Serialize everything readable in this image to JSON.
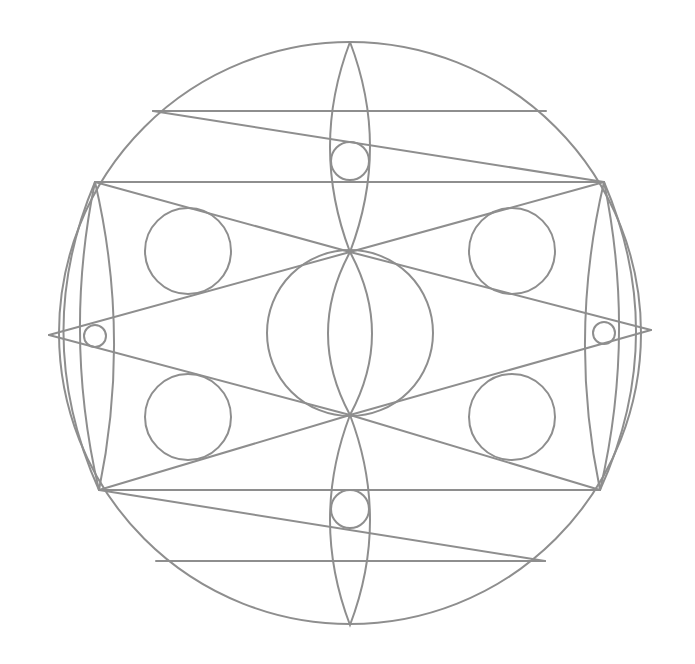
{
  "diagram": {
    "type": "geometric-mandala",
    "stroke_color": "#8e8e8e",
    "background_color": "#ffffff",
    "outer_circle": {
      "cx": 350,
      "cy": 333,
      "r": 291
    },
    "horizontal_lines": [
      {
        "x1": 153,
        "y1": 111,
        "x2": 546,
        "y2": 111
      },
      {
        "x1": 95,
        "y1": 182,
        "x2": 604,
        "y2": 182
      },
      {
        "x1": 99,
        "y1": 490,
        "x2": 600,
        "y2": 490
      },
      {
        "x1": 156,
        "y1": 561,
        "x2": 545,
        "y2": 561
      }
    ],
    "diagonal_lines": [
      {
        "x1": 153,
        "y1": 111,
        "x2": 604,
        "y2": 182
      },
      {
        "x1": 99,
        "y1": 490,
        "x2": 545,
        "y2": 561
      },
      {
        "x1": 95,
        "y1": 182,
        "x2": 350,
        "y2": 252
      },
      {
        "x1": 604,
        "y1": 182,
        "x2": 350,
        "y2": 252
      },
      {
        "x1": 99,
        "y1": 490,
        "x2": 350,
        "y2": 415
      },
      {
        "x1": 600,
        "y1": 490,
        "x2": 350,
        "y2": 415
      },
      {
        "x1": 49,
        "y1": 335,
        "x2": 350,
        "y2": 252
      },
      {
        "x1": 49,
        "y1": 335,
        "x2": 350,
        "y2": 415
      },
      {
        "x1": 651,
        "y1": 330,
        "x2": 350,
        "y2": 252
      },
      {
        "x1": 651,
        "y1": 330,
        "x2": 350,
        "y2": 415
      }
    ],
    "vesicas": [
      {
        "name": "top",
        "p1": [
          350,
          42
        ],
        "p2": [
          350,
          252
        ],
        "bulge": 20
      },
      {
        "name": "center",
        "p1": [
          350,
          252
        ],
        "p2": [
          350,
          415
        ],
        "bulge": 22
      },
      {
        "name": "bottom",
        "p1": [
          350,
          415
        ],
        "p2": [
          350,
          625
        ],
        "bulge": 20
      },
      {
        "name": "left",
        "p1": [
          95,
          182
        ],
        "p2": [
          99,
          490
        ],
        "bulge": 17
      },
      {
        "name": "right",
        "p1": [
          604,
          182
        ],
        "p2": [
          600,
          490
        ],
        "bulge": 17
      }
    ],
    "outer_arcs": [
      {
        "name": "left-arc",
        "d": "M 95 182 Q 30 336 99 490"
      },
      {
        "name": "right-arc",
        "d": "M 604 182 Q 670 336 600 490"
      }
    ],
    "circles": [
      {
        "name": "center-large",
        "cx": 350,
        "cy": 333,
        "r": 83
      },
      {
        "name": "upper-left",
        "cx": 188,
        "cy": 251,
        "r": 43
      },
      {
        "name": "upper-right",
        "cx": 512,
        "cy": 251,
        "r": 43
      },
      {
        "name": "lower-left",
        "cx": 188,
        "cy": 417,
        "r": 43
      },
      {
        "name": "lower-right",
        "cx": 512,
        "cy": 417,
        "r": 43
      },
      {
        "name": "top-small",
        "cx": 350,
        "cy": 161,
        "r": 19
      },
      {
        "name": "bottom-small",
        "cx": 350,
        "cy": 509,
        "r": 19
      },
      {
        "name": "left-small",
        "cx": 95,
        "cy": 336,
        "r": 11
      },
      {
        "name": "right-small",
        "cx": 604,
        "cy": 333,
        "r": 11
      }
    ]
  }
}
